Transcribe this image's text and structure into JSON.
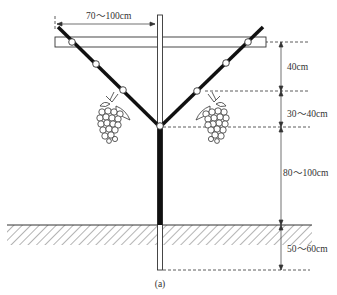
{
  "figure": {
    "caption": "(a)",
    "type": "Y-shaped grape trellis structure diagram"
  },
  "dimensions": {
    "arm_span": "70～100cm",
    "top_segment": "40cm",
    "middle_segment": "30～40cm",
    "trunk_height": "80～100cm",
    "burial_depth": "50～60cm"
  },
  "colors": {
    "line": "#111111",
    "text": "#333333",
    "background": "#ffffff"
  }
}
